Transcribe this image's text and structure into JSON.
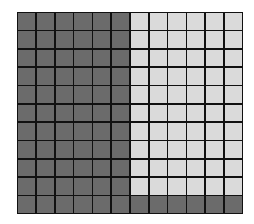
{
  "figure": {
    "type": "shaded-grid",
    "rows": 11,
    "columns": 12,
    "total_cells": 132,
    "shaded_cells": 72,
    "unshaded_cells": 60,
    "colors": {
      "shaded": "#6b6b6b",
      "unshaded": "#dadada",
      "grid_lines": "#111111",
      "background": "#ffffff"
    },
    "shading_rule": {
      "rows_1_to_10": "first 6 columns shaded, last 6 columns unshaded",
      "row_11": "all 12 columns shaded"
    },
    "grid_rows": [
      [
        1,
        1,
        1,
        1,
        1,
        1,
        0,
        0,
        0,
        0,
        0,
        0
      ],
      [
        1,
        1,
        1,
        1,
        1,
        1,
        0,
        0,
        0,
        0,
        0,
        0
      ],
      [
        1,
        1,
        1,
        1,
        1,
        1,
        0,
        0,
        0,
        0,
        0,
        0
      ],
      [
        1,
        1,
        1,
        1,
        1,
        1,
        0,
        0,
        0,
        0,
        0,
        0
      ],
      [
        1,
        1,
        1,
        1,
        1,
        1,
        0,
        0,
        0,
        0,
        0,
        0
      ],
      [
        1,
        1,
        1,
        1,
        1,
        1,
        0,
        0,
        0,
        0,
        0,
        0
      ],
      [
        1,
        1,
        1,
        1,
        1,
        1,
        0,
        0,
        0,
        0,
        0,
        0
      ],
      [
        1,
        1,
        1,
        1,
        1,
        1,
        0,
        0,
        0,
        0,
        0,
        0
      ],
      [
        1,
        1,
        1,
        1,
        1,
        1,
        0,
        0,
        0,
        0,
        0,
        0
      ],
      [
        1,
        1,
        1,
        1,
        1,
        1,
        0,
        0,
        0,
        0,
        0,
        0
      ],
      [
        1,
        1,
        1,
        1,
        1,
        1,
        1,
        1,
        1,
        1,
        1,
        1
      ]
    ]
  }
}
